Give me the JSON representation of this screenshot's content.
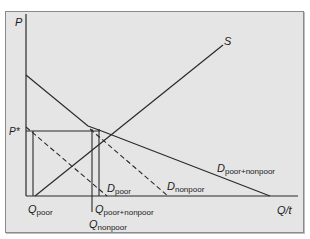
{
  "diagram": {
    "type": "supply-demand",
    "axes": {
      "y_label": "P",
      "x_label": "Q/t"
    },
    "price_label": "P*",
    "curves": [
      {
        "id": "S",
        "label": "S",
        "style": "solid"
      },
      {
        "id": "D_poor",
        "label_main": "D",
        "label_sub": "poor",
        "style": "dashed"
      },
      {
        "id": "D_nonpoor",
        "label_main": "D",
        "label_sub": "nonpoor",
        "style": "dashed"
      },
      {
        "id": "D_total",
        "label_main": "D",
        "label_sub": "poor+nonpoor",
        "style": "solid"
      }
    ],
    "quantity_labels": [
      {
        "main": "Q",
        "sub": "poor"
      },
      {
        "main": "Q",
        "sub": "poor+nonpoor"
      },
      {
        "main": "Q",
        "sub": "nonpoor"
      }
    ],
    "colors": {
      "background": "#e5e5e5",
      "line": "#2a2a2a",
      "frame": "#8a8a8a"
    }
  }
}
